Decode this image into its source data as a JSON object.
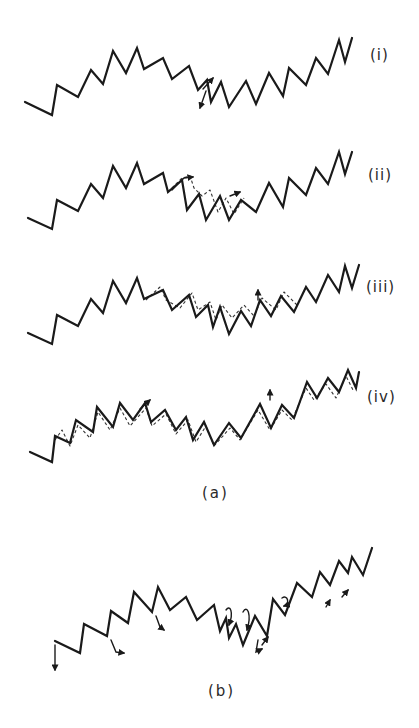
{
  "figure": {
    "part_a": {
      "caption": "(a)",
      "rows": [
        {
          "label": "(i)",
          "chain": "25,102 52,115 57,85 78,97 91,70 103,84 113,51 126,73 137,48 144,69 163,58 172,79 189,66 198,90 207,80 211,102 221,82 229,107 246,81 256,104 269,73 283,96 289,68 306,85 316,58 328,74 339,40 345,62 352,38",
          "ghost": "",
          "arrows": [
            {
              "d": "M206,91 L200,108",
              "head": "200,108"
            },
            {
              "d": "M203,89 L213,78",
              "head": "213,78"
            }
          ]
        },
        {
          "label": "(ii)",
          "chain": "28,218 52,229 57,200 78,211 91,184 103,198 113,166 126,188 137,163 144,184 163,173 168,192 182,180 187,210 199,194 206,220 220,196 229,220 241,200 256,212 269,183 283,207 289,178 306,195 316,168 328,184 339,152 345,174 352,152",
          "ghost": "168,192 182,178 190,176 194,188 202,196 210,190 218,212 226,198 234,214 244,198",
          "arrows": [
            {
              "d": "M172,190 L184,178 L193,177",
              "head": "193,177"
            },
            {
              "d": "M230,196 L240,192",
              "head": "240,192"
            }
          ]
        },
        {
          "label": "(iii)",
          "chain": "28,333 52,344 57,315 78,326 91,299 103,313 113,281 126,303 137,278 144,299 163,290 172,310 189,295 196,317 208,305 213,327 220,307 229,334 241,311 251,326 260,300 271,316 281,296 294,312 306,287 316,302 328,275 339,292 345,266 352,288 359,265",
          "ghost": "146,300 160,287 166,300 180,308 192,293 198,310 210,302 216,320 222,305 232,318 244,305 254,316 262,298 276,310 284,292 298,306",
          "arrows": [
            {
              "d": "M258,300 L258,290",
              "head": "258,290"
            }
          ]
        },
        {
          "label": "(iv)",
          "chain": "30,452 52,462 55,436 70,443 76,420 93,432 97,407 113,427 120,403 133,420 145,403 151,422 165,410 176,430 186,417 193,440 204,422 214,445 229,423 241,438 260,404 271,428 282,405 294,418 307,382 317,398 328,378 339,392 348,370 356,388 359,372",
          "ghost": "55,440 62,430 70,446 78,425 90,438 98,412 110,430 120,408 130,426 146,408 152,426 166,414 176,434 188,420 196,442 206,426 214,446 230,428 240,440 258,410 270,430 282,410 292,420 306,388 314,400 326,384 336,398 346,376 354,392",
          "arrows": [
            {
              "d": "M140,409 L150,400",
              "head": "150,400"
            },
            {
              "d": "M270,400 L270,390",
              "head": "270,390"
            }
          ]
        }
      ]
    },
    "part_b": {
      "caption": "(b)",
      "chain": "55,641 80,653 84,624 107,636 111,611 128,623 134,592 152,612 158,587 170,610 186,597 197,620 214,605 220,631 226,618 229,638 236,624 243,645 255,616 267,636 273,599 285,615 297,583 312,597 320,572 330,585 339,561 348,573 352,557 363,575 372,548",
      "arrows": [
        {
          "d": "M55,645 L55,670",
          "head": "55,670"
        },
        {
          "d": "M111,640 L116,652 L124,653",
          "head": "124,653"
        },
        {
          "d": "M156,616 L160,627 L164,630",
          "head": "164,630"
        },
        {
          "d": "M226,610 C230,604 234,612 229,625",
          "head": "229,625"
        },
        {
          "d": "M243,612 C247,604 252,614 247,630",
          "head": "247,630"
        },
        {
          "d": "M258,640 L256,652 L262,649",
          "head": "262,649"
        },
        {
          "d": "M262,645 L268,637",
          "head": "268,637"
        },
        {
          "d": "M282,598 C288,594 290,604 284,606",
          "head": "284,606"
        },
        {
          "d": "M326,607 L330,600",
          "head": "330,600"
        },
        {
          "d": "M342,597 L348,590",
          "head": "348,590"
        }
      ]
    }
  }
}
